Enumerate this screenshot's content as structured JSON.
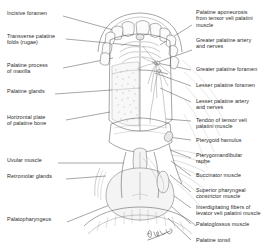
{
  "figure": {
    "artist_signature": "artist-signature"
  },
  "labels_left": [
    {
      "id": "incisive-foramen",
      "text": "Incisive foramen"
    },
    {
      "id": "transverse-palatine-folds",
      "text": "Transverse palatine\nfolds (rugae)"
    },
    {
      "id": "palatine-process-of-maxilla",
      "text": "Palatine process\nof maxilla"
    },
    {
      "id": "palatine-glands",
      "text": "Palatine glands"
    },
    {
      "id": "horizontal-plate-of-palatine-bone",
      "text": "Horizontal plate\nof palatine bone"
    },
    {
      "id": "uvular-muscle",
      "text": "Uvular muscle"
    },
    {
      "id": "retromolar-glands",
      "text": "Retromolar glands"
    },
    {
      "id": "palatopharyngeus",
      "text": "Palatopharyngeus"
    }
  ],
  "labels_right": [
    {
      "id": "palatine-aponeurosis",
      "text": "Palatine aponeurosis\nfrom tensor veli palatini\nmuscle"
    },
    {
      "id": "greater-palatine-artery-and-nerves",
      "text": "Greater palatine artery\nand nerves"
    },
    {
      "id": "greater-palatine-foramen",
      "text": "Greater palatine foramen"
    },
    {
      "id": "lesser-palatine-foramen",
      "text": "Lesser palatine foramen"
    },
    {
      "id": "lesser-palatine-artery-and-nerves",
      "text": "Lesser palatine artery\nand nerves"
    },
    {
      "id": "tendon-of-tensor-veli-palatini-muscle",
      "text": "Tendon of tensor veli\npalatini muscle"
    },
    {
      "id": "pterygoid-hamulus",
      "text": "Pterygoid hamulus"
    },
    {
      "id": "pterygomandibular-raphe",
      "text": "Pterygomandibular\nraphe"
    },
    {
      "id": "buccinator-muscle",
      "text": "Buccinator muscle"
    },
    {
      "id": "superior-pharyngeal-constrictor-muscle",
      "text": "Superior pharyngeal\nconstrictor muscle"
    },
    {
      "id": "interdigitating-fibers-of-levator-veli-palatini-muscle",
      "text": "Interdigitating fibers of\nlevator veli palatini muscle"
    },
    {
      "id": "palatoglossus-muscle",
      "text": "Palatoglossus muscle"
    },
    {
      "id": "palatine-tonsil",
      "text": "Palatine tonsil"
    }
  ],
  "colors": {
    "background": "#ffffff",
    "ink": "#2b2b2b",
    "leader": "#3a3a3a",
    "artwork_stroke": "#4a4a4a"
  }
}
